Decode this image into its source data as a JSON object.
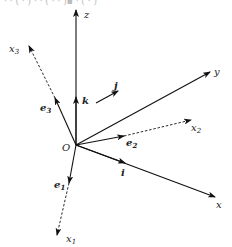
{
  "diagram": {
    "origin": {
      "label": "O",
      "x": 76,
      "y": 145
    },
    "top_fragment": "(cut-off text above)",
    "axes": [
      {
        "id": "z",
        "label": "z",
        "style": "solid",
        "to": [
          76,
          10
        ],
        "label_pos": [
          84,
          18
        ]
      },
      {
        "id": "y",
        "label": "y",
        "style": "solid",
        "to": [
          210,
          72
        ],
        "label_pos": [
          214,
          74
        ]
      },
      {
        "id": "x",
        "label": "x",
        "style": "solid",
        "to": [
          215,
          197
        ],
        "label_pos": [
          216,
          207
        ]
      },
      {
        "id": "x3",
        "label": "x",
        "sub": "3",
        "style": "dashed",
        "to": [
          29,
          46
        ],
        "label_pos": [
          10,
          50
        ]
      },
      {
        "id": "x2",
        "label": "x",
        "sub": "2",
        "style": "dashed",
        "to": [
          191,
          120
        ],
        "label_pos": [
          192,
          130
        ]
      },
      {
        "id": "x1",
        "label": "x",
        "sub": "1",
        "style": "dashed",
        "to": [
          57,
          235
        ],
        "label_pos": [
          66,
          242
        ]
      }
    ],
    "unit_vectors": [
      {
        "id": "k",
        "label": "k",
        "to": [
          76,
          97
        ],
        "label_pos": [
          83,
          104
        ]
      },
      {
        "id": "j",
        "label": "j",
        "to": [
          118,
          92
        ],
        "label_pos": [
          115,
          92
        ]
      },
      {
        "id": "i",
        "label": "i",
        "to": [
          125,
          161
        ],
        "label_pos": [
          122,
          177
        ]
      },
      {
        "id": "e3",
        "label": "e",
        "sub": "3",
        "to": [
          55,
          98
        ],
        "label_pos": [
          40,
          111
        ]
      },
      {
        "id": "e2",
        "label": "e",
        "sub": "2",
        "to": [
          124,
          136
        ],
        "label_pos": [
          126,
          145
        ]
      },
      {
        "id": "e1",
        "label": "e",
        "sub": "1",
        "to": [
          69,
          183
        ],
        "label_pos": [
          54,
          187
        ]
      }
    ]
  }
}
